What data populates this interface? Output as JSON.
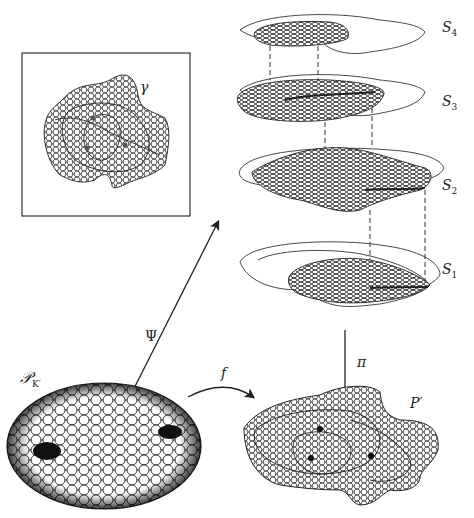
{
  "figure": {
    "type": "circle-packing-covering-diagram",
    "labels": {
      "gamma": "γ",
      "psi": "Ψ",
      "pi": "π",
      "f": "f",
      "p_prime": "P′",
      "pk_script": "𝒫",
      "pk_sub": "K′",
      "sheets": [
        {
          "name": "S",
          "sub": "4"
        },
        {
          "name": "S",
          "sub": "3"
        },
        {
          "name": "S",
          "sub": "2"
        },
        {
          "name": "S",
          "sub": "1"
        }
      ]
    },
    "panels": {
      "inset": "boxed immersed circle packing with closed curve γ and three branch points",
      "stack": "four sheets S1–S4 of a branched covering connected by dashed lines",
      "disk": "maximal circle packing of disk with two dark holes",
      "image": "immersed packing P′ with three branch points"
    },
    "colors": {
      "ink": "#222222",
      "background": "#ffffff"
    }
  }
}
